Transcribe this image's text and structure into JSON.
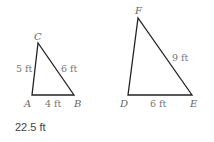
{
  "triangle_abc": {
    "vertices": {
      "A": "A",
      "B": "B",
      "C": "C"
    },
    "sides": {
      "AC": "5 ft",
      "CB": "6 ft",
      "AB": "4 ft"
    }
  },
  "triangle_def": {
    "vertices": {
      "D": "D",
      "E": "E",
      "F": "F"
    },
    "sides": {
      "FE": "9 ft",
      "DE": "6 ft"
    }
  },
  "answer": "22.5 ft",
  "colors": {
    "line": "#222222",
    "label": "#777777"
  }
}
